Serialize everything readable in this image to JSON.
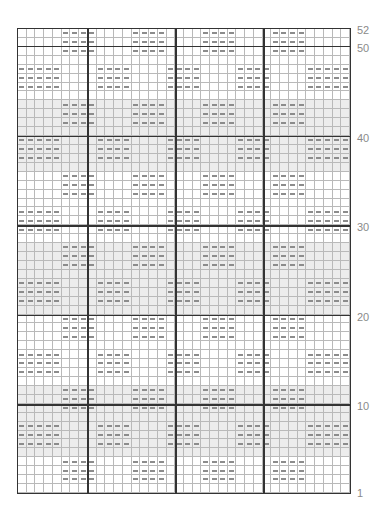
{
  "chart_data": {
    "type": "table",
    "title": "",
    "columns": 38,
    "rows": 52,
    "row_labels": [
      {
        "row": 52,
        "text": "52"
      },
      {
        "row": 50,
        "text": "50"
      },
      {
        "row": 40,
        "text": "40"
      },
      {
        "row": 30,
        "text": "30"
      },
      {
        "row": 20,
        "text": "20"
      },
      {
        "row": 10,
        "text": "10"
      },
      {
        "row": 1,
        "text": "1"
      }
    ],
    "bold_vertical_after_columns": [
      8,
      18,
      28
    ],
    "bold_horizontal_at_rows": [
      50,
      40,
      30,
      20,
      10
    ],
    "pattern_A_columns": [
      1,
      2,
      3,
      4,
      5,
      10,
      11,
      12,
      13,
      18,
      19,
      20,
      21,
      26,
      27,
      28,
      29,
      34,
      35,
      36,
      37,
      38
    ],
    "pattern_B_columns": [
      6,
      7,
      8,
      9,
      14,
      15,
      16,
      17,
      22,
      23,
      24,
      25,
      30,
      31,
      32,
      33
    ],
    "row_pattern_cycle": [
      "B",
      "B",
      "B",
      "none",
      "A",
      "A",
      "A",
      "none"
    ],
    "symbol": "dash",
    "colors": {
      "grid": "#b9b9b9",
      "bold": "#333333",
      "dash": "#8c8c8c",
      "shade": "#ececec"
    }
  }
}
